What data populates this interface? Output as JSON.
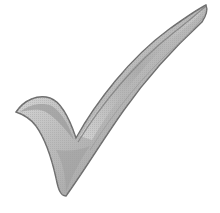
{
  "image": {
    "subject": "checkmark",
    "alt": "Grey 3D checkmark",
    "background_color": "#ffffff",
    "colors": {
      "light": "#e6e6e6",
      "mid": "#b9b9b9",
      "dark": "#7a7a7a",
      "edge": "#5e5e5e"
    }
  }
}
